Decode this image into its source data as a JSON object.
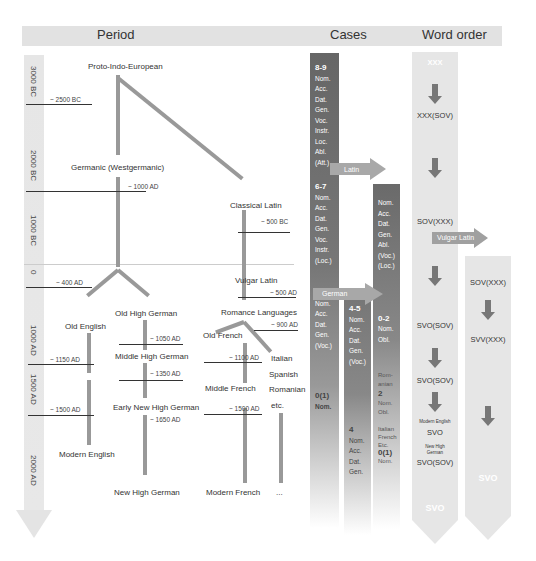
{
  "headers": {
    "period": "Period",
    "cases": "Cases",
    "word_order": "Word order"
  },
  "timeline": {
    "labels": [
      "3000 BC",
      "2000 BC",
      "1000 BC",
      "0",
      "1000 AD",
      "1500 AD",
      "2000 AD"
    ]
  },
  "languages": {
    "pie": "Proto-Indo-European",
    "germanic": "Germanic (Westgermanic)",
    "classical_latin": "Classical Latin",
    "vulgar_latin": "Vulgar Latin",
    "romance": "Romance Languages",
    "old_english": "Old English",
    "old_high_german": "Old High German",
    "middle_high_german": "Middle High German",
    "early_new_high_german": "Early New High German",
    "new_high_german": "New High German",
    "modern_english": "Modern English",
    "old_french": "Old French",
    "middle_french": "Middle French",
    "modern_french": "Modern French",
    "italian": "Italian",
    "spanish": "Spanish",
    "romanian": "Romanian",
    "etc": "etc.",
    "ellipsis": "..."
  },
  "dates": {
    "d2500bc": "~ 2500 BC",
    "d1000ad_germanic": "~ 1000 AD",
    "d500bc": "~ 500 BC",
    "d400ad": "~ 400 AD",
    "d500ad": "~ 500 AD",
    "d900ad": "~ 900 AD",
    "d1050ad": "~ 1050 AD",
    "d1150ad": "~ 1150 AD",
    "d1100ad": "~ 1100 AD",
    "d1350ad": "~ 1350 AD",
    "d1500ad_left": "~ 1500 AD",
    "d1500ad_french": "~ 1500 AD",
    "d1650ad": "~ 1650 AD"
  },
  "cases": {
    "pie": {
      "count": "8-9",
      "items": [
        "Nom.",
        "Acc.",
        "Dat.",
        "Gen.",
        "Voc.",
        "Instr.",
        "Loc.",
        "Abl.",
        "(Att.)"
      ]
    },
    "germanic": {
      "count": "6-7",
      "items": [
        "Nom.",
        "Acc.",
        "Dat.",
        "Gen.",
        "Voc.",
        "Instr.",
        "(Loc.)"
      ]
    },
    "old_english": {
      "count": "4-5",
      "items": [
        "Nom.",
        "Acc.",
        "Dat.",
        "Gen.",
        "(Voc.)"
      ]
    },
    "modern_english": {
      "count": "0(1)",
      "items": [
        "Nom."
      ]
    },
    "german": {
      "count": "4-5",
      "items": [
        "Nom.",
        "Acc.",
        "Dat.",
        "Gen.",
        "(Voc.)"
      ]
    },
    "modern_german": {
      "count": "4",
      "items": [
        "Nom.",
        "Acc.",
        "Dat.",
        "Gen."
      ]
    },
    "latin": {
      "count": "",
      "items": [
        "Nom.",
        "Acc.",
        "Dat.",
        "Gen.",
        "Abl.",
        "(Voc.)",
        "(Loc.)"
      ]
    },
    "old_romance": {
      "count": "0-2",
      "items": [
        "Nom.",
        "Obl."
      ]
    },
    "romanian": {
      "label": "Rom-anian",
      "count": "2",
      "items": [
        "Nom.",
        "Obl."
      ]
    },
    "it_fr": {
      "label": "Italian French Etc.",
      "count": "0(1)",
      "items": [
        "Nom."
      ]
    },
    "arrows": {
      "latin": "Latin",
      "german": "German"
    }
  },
  "word_order": {
    "main": [
      "XXX",
      "XXX(SOV)",
      "SOV(XXX)",
      "SVO(SOV)",
      "SVO(SOV)"
    ],
    "modern_english_label": "Modern English",
    "modern_english_value": "SVO",
    "new_high_german_label": "New High German",
    "new_high_german_value": "SVO(SOV)",
    "main_end": "SVO",
    "vulgar_latin_arrow": "Vulgar Latin",
    "romance": [
      "SOV(XXX)",
      "SVV(XXX)"
    ],
    "romance_end": "SVO"
  },
  "colors": {
    "case_dark": "#6f6f6f",
    "case_mid": "#8a8a8a",
    "word_bg": "#e6e6e6",
    "branch": "#999999",
    "arrow_fill": "#999999"
  }
}
